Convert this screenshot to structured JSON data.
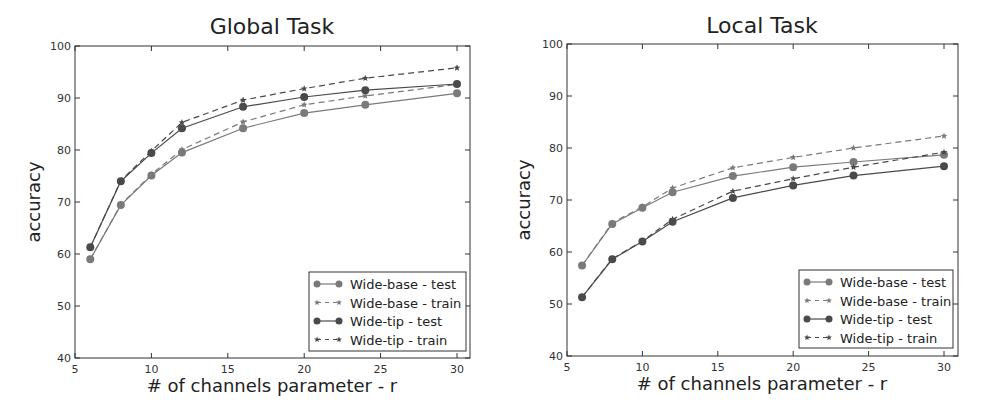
{
  "chart_data": [
    {
      "type": "line",
      "title": "Global Task",
      "xlabel": "# of channels parameter - r",
      "ylabel": "accuracy",
      "xlim": [
        5,
        31
      ],
      "ylim": [
        40,
        100
      ],
      "xticks": [
        5,
        10,
        15,
        20,
        25,
        30
      ],
      "yticks": [
        40,
        50,
        60,
        70,
        80,
        90,
        100
      ],
      "grid": false,
      "legend_position": "lower right",
      "x": [
        6,
        8,
        10,
        12,
        16,
        20,
        24,
        30
      ],
      "series": [
        {
          "name": "Wide-base - test",
          "style": "solid",
          "marker": "circle",
          "color": "#7a7a7a",
          "values": [
            59.0,
            69.4,
            75.1,
            79.5,
            84.2,
            87.1,
            88.7,
            90.9
          ]
        },
        {
          "name": "Wide-base - train",
          "style": "dashed",
          "marker": "star",
          "color": "#7a7a7a",
          "values": [
            59.0,
            69.5,
            75.3,
            80.1,
            85.4,
            88.7,
            90.4,
            92.6
          ]
        },
        {
          "name": "Wide-tip - test",
          "style": "solid",
          "marker": "circle",
          "color": "#4a4a4a",
          "values": [
            61.3,
            74.0,
            79.4,
            84.2,
            88.3,
            90.2,
            91.5,
            92.7
          ]
        },
        {
          "name": "Wide-tip - train",
          "style": "dashed",
          "marker": "star",
          "color": "#4a4a4a",
          "values": [
            61.3,
            74.1,
            79.8,
            85.3,
            89.6,
            91.8,
            93.8,
            95.8
          ]
        }
      ]
    },
    {
      "type": "line",
      "title": "Local Task",
      "xlabel": "# of channels parameter - r",
      "ylabel": "accuracy",
      "xlim": [
        5,
        31
      ],
      "ylim": [
        40,
        100
      ],
      "xticks": [
        5,
        10,
        15,
        20,
        25,
        30
      ],
      "yticks": [
        40,
        50,
        60,
        70,
        80,
        90,
        100
      ],
      "grid": false,
      "legend_position": "lower right",
      "x": [
        6,
        8,
        10,
        12,
        16,
        20,
        24,
        30
      ],
      "series": [
        {
          "name": "Wide-base - test",
          "style": "solid",
          "marker": "circle",
          "color": "#7a7a7a",
          "values": [
            57.4,
            65.4,
            68.5,
            71.5,
            74.6,
            76.3,
            77.3,
            78.7
          ]
        },
        {
          "name": "Wide-base - train",
          "style": "dashed",
          "marker": "star",
          "color": "#7a7a7a",
          "values": [
            57.4,
            65.6,
            68.7,
            72.3,
            76.2,
            78.2,
            80.0,
            82.3
          ]
        },
        {
          "name": "Wide-tip - test",
          "style": "solid",
          "marker": "circle",
          "color": "#4a4a4a",
          "values": [
            51.3,
            58.6,
            62.0,
            65.8,
            70.4,
            72.8,
            74.7,
            76.5
          ]
        },
        {
          "name": "Wide-tip - train",
          "style": "dashed",
          "marker": "star",
          "color": "#4a4a4a",
          "values": [
            51.3,
            58.7,
            62.1,
            66.3,
            71.7,
            74.1,
            76.3,
            79.2
          ]
        }
      ]
    }
  ],
  "charts": [
    {
      "title": "Global Task",
      "xlabel": "# of channels parameter - r",
      "ylabel": "accuracy",
      "legend": [
        "Wide-base - test",
        "Wide-base - train",
        "Wide-tip - test",
        "Wide-tip - train"
      ]
    },
    {
      "title": "Local Task",
      "xlabel": "# of channels parameter - r",
      "ylabel": "accuracy",
      "legend": [
        "Wide-base - test",
        "Wide-base - train",
        "Wide-tip - test",
        "Wide-tip - train"
      ]
    }
  ]
}
